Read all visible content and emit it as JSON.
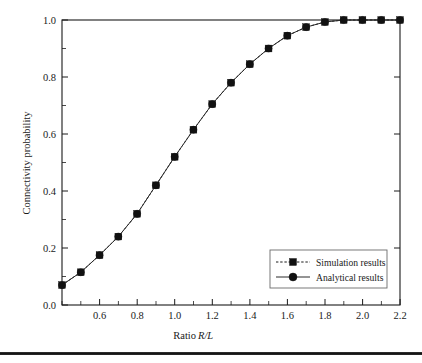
{
  "chart_data": {
    "type": "line",
    "title": "",
    "xlabel": "Ratio R/L",
    "xlabel_plain": "Ratio ",
    "xlabel_italic": "R/L",
    "ylabel": "Connectivity probability",
    "xlim": [
      0.5,
      2.3
    ],
    "ylim": [
      0.0,
      1.0
    ],
    "grid": false,
    "legend_position": "lower right",
    "x_ticks": [
      0.6,
      0.8,
      1.0,
      1.2,
      1.4,
      1.6,
      1.8,
      2.0,
      2.2
    ],
    "x_tick_labels": [
      "0.6",
      "0.8",
      "1.0",
      "1.2",
      "1.4",
      "1.6",
      "1.8",
      "2.0",
      "2.2"
    ],
    "x_minor_ticks": [
      0.5,
      0.7,
      0.9,
      1.1,
      1.3,
      1.5,
      1.7,
      1.9,
      2.1,
      2.3
    ],
    "y_ticks": [
      0.0,
      0.2,
      0.4,
      0.6,
      0.8,
      1.0
    ],
    "y_tick_labels": [
      "0.0",
      "0.2",
      "0.4",
      "0.6",
      "0.8",
      "1.0"
    ],
    "y_minor_ticks": [
      0.1,
      0.3,
      0.5,
      0.7,
      0.9
    ],
    "x": [
      0.5,
      0.6,
      0.7,
      0.8,
      0.9,
      1.0,
      1.1,
      1.2,
      1.3,
      1.4,
      1.5,
      1.6,
      1.7,
      1.8,
      1.9,
      2.0,
      2.1,
      2.2,
      2.3
    ],
    "series": [
      {
        "name": "Simulation results",
        "marker": "square",
        "linestyle": "dashed",
        "color": "#111111",
        "values": [
          0.07,
          0.115,
          0.175,
          0.24,
          0.32,
          0.42,
          0.52,
          0.615,
          0.705,
          0.78,
          0.845,
          0.9,
          0.945,
          0.975,
          0.993,
          1.0,
          1.0,
          1.0,
          1.0
        ]
      },
      {
        "name": "Analytical results",
        "marker": "circle",
        "linestyle": "solid",
        "color": "#2a2a2a",
        "values": [
          0.07,
          0.115,
          0.175,
          0.24,
          0.32,
          0.42,
          0.52,
          0.615,
          0.705,
          0.78,
          0.845,
          0.9,
          0.945,
          0.975,
          0.993,
          1.0,
          1.0,
          1.0,
          1.0
        ]
      }
    ]
  },
  "legend": {
    "entries": [
      {
        "label": "Simulation results"
      },
      {
        "label": "Analytical results"
      }
    ]
  },
  "colors": {
    "axis": "#1a1a1a",
    "marker": "#111111",
    "legend_border": "#6a6a6a",
    "rule": "#121212"
  }
}
